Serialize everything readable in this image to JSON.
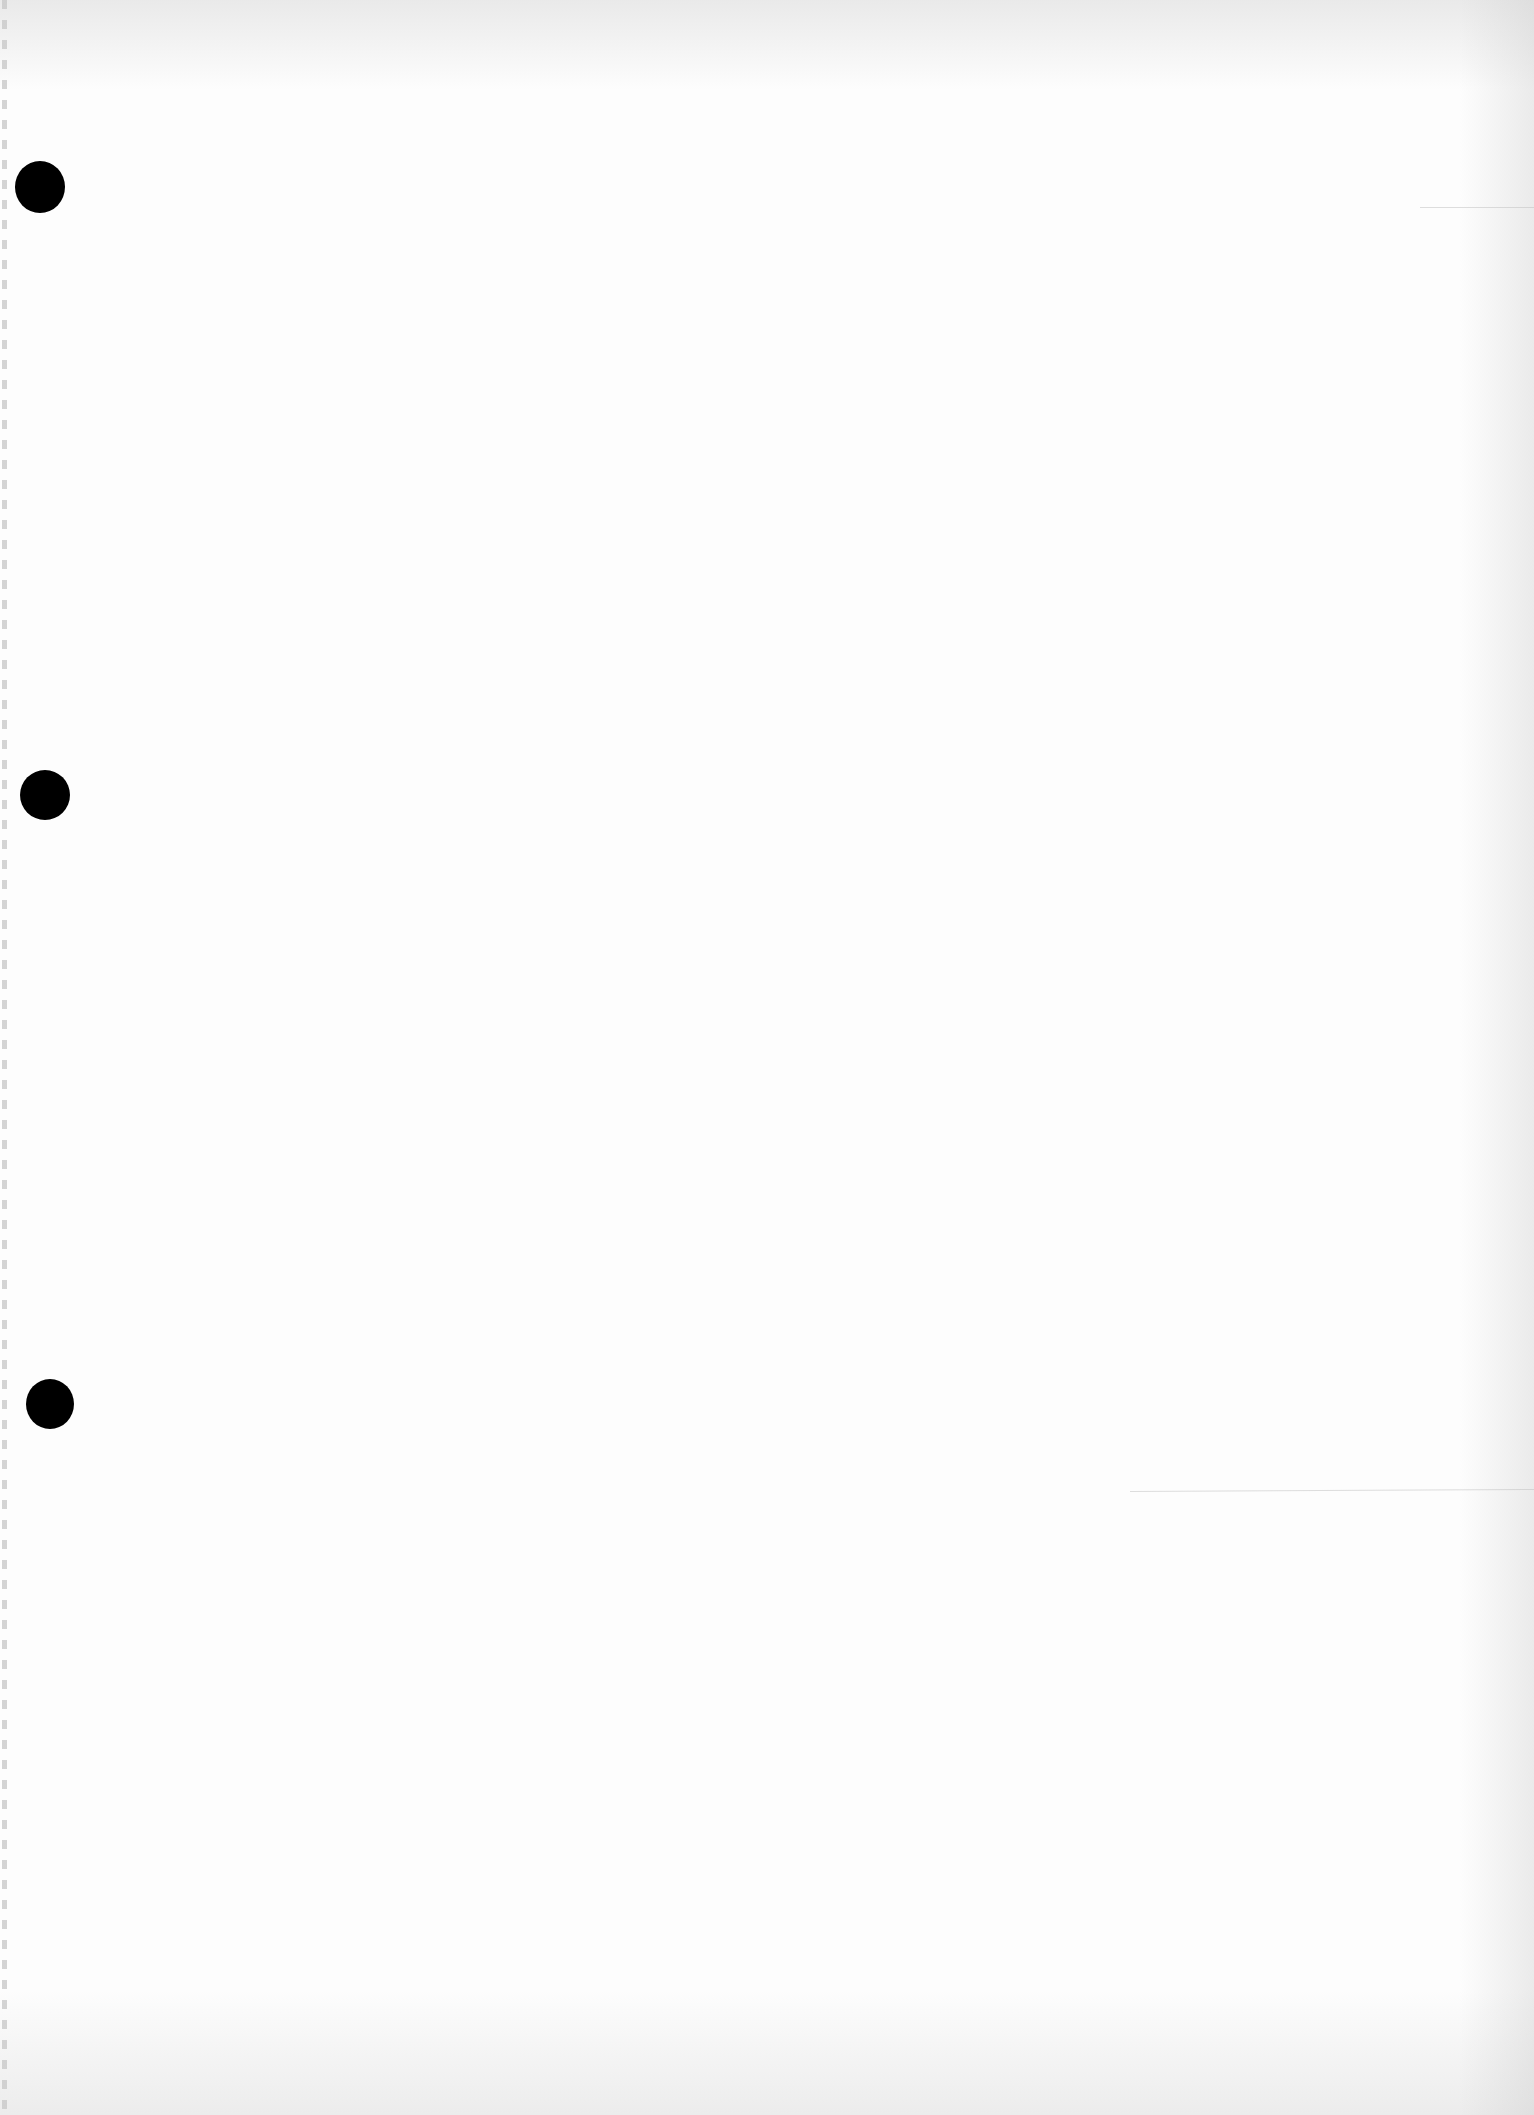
{
  "document": {
    "type": "blank-loose-leaf-page",
    "text_content": "",
    "paper_color": "#fdfdfd",
    "punch_holes": [
      {
        "id": "top",
        "cx": 40,
        "cy": 187,
        "w": 50,
        "h": 52
      },
      {
        "id": "middle",
        "cx": 45,
        "cy": 795,
        "w": 50,
        "h": 50
      },
      {
        "id": "bottom",
        "cx": 50,
        "cy": 1404,
        "w": 48,
        "h": 50
      }
    ],
    "hole_color": "#000000"
  }
}
